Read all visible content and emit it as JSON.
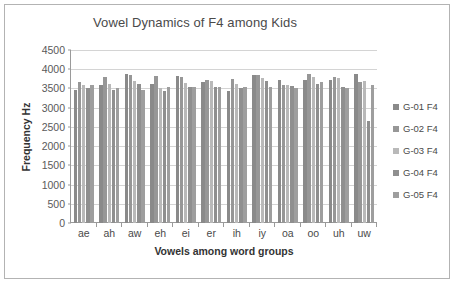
{
  "chart_data": {
    "type": "bar",
    "title": "Vowel Dynamics of F4 among Kids",
    "xlabel": "Vowels among word groups",
    "ylabel": "Frequency Hz",
    "ylim": [
      0,
      4500
    ],
    "ytick_step": 500,
    "yticks": [
      4500,
      4000,
      3500,
      3000,
      2500,
      2000,
      1500,
      1000,
      500,
      0
    ],
    "grid": true,
    "legend_position": "right",
    "categories": [
      "ae",
      "ah",
      "aw",
      "eh",
      "ei",
      "er",
      "ih",
      "iy",
      "oa",
      "oo",
      "uh",
      "uw"
    ],
    "series": [
      {
        "name": "G-01 F4",
        "color": "#8a8a8a",
        "values": [
          3460,
          3600,
          3870,
          3620,
          3830,
          3680,
          3440,
          3840,
          3710,
          3720,
          3720,
          3870
        ]
      },
      {
        "name": "G-02 F4",
        "color": "#979797",
        "values": [
          3680,
          3790,
          3840,
          3820,
          3810,
          3720,
          3750,
          3860,
          3590,
          3870,
          3800,
          3680
        ]
      },
      {
        "name": "G-03 F4",
        "color": "#b9b9b9",
        "values": [
          3590,
          3620,
          3700,
          3510,
          3630,
          3690,
          3620,
          3760,
          3580,
          3790,
          3760,
          3700
        ]
      },
      {
        "name": "G-04 F4",
        "color": "#8f8f8f",
        "values": [
          3500,
          3450,
          3610,
          3430,
          3530,
          3530,
          3520,
          3690,
          3570,
          3620,
          3540,
          2650
        ]
      },
      {
        "name": "G-05 F4",
        "color": "#9e9e9e",
        "values": [
          3590,
          3500,
          3470,
          3540,
          3540,
          3540,
          3540,
          3550,
          3510,
          3670,
          3510,
          3600
        ]
      }
    ]
  }
}
